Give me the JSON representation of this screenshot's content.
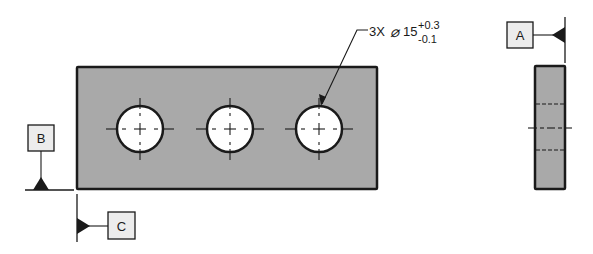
{
  "colors": {
    "part_fill": "#a9a9a9",
    "outline": "#1a1a1a",
    "hole_fill": "#ffffff",
    "datum_box_fill": "#ececec",
    "background": "#ffffff"
  },
  "callout": {
    "count": "3X",
    "diameter_symbol": "⌀",
    "nominal": "15",
    "upper_tolerance": "+0.3",
    "lower_tolerance": "-0.1"
  },
  "datums": {
    "a": {
      "label": "A"
    },
    "b": {
      "label": "B"
    },
    "c": {
      "label": "C"
    }
  },
  "front_view": {
    "holes": [
      {
        "cx": 140,
        "cy": 129,
        "r": 23
      },
      {
        "cx": 230,
        "cy": 129,
        "r": 23
      },
      {
        "cx": 319,
        "cy": 129,
        "r": 23
      }
    ]
  }
}
